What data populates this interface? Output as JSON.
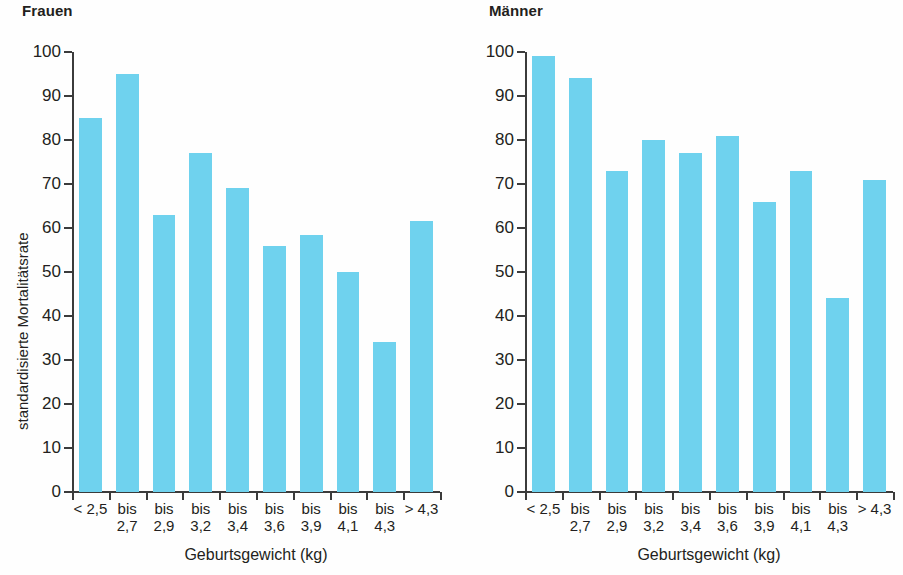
{
  "figure": {
    "bar_color": "#6fd2ee",
    "axis_color": "#3b3b3b",
    "text_color": "#231f20"
  },
  "axis": {
    "y_title": "standardisierte Mortalitätsrate",
    "x_title": "Geburtsgewicht (kg)",
    "y_ticks": [
      "100",
      "90",
      "80",
      "70",
      "60",
      "50",
      "40",
      "30",
      "20",
      "10",
      "0"
    ],
    "y_min": 0,
    "y_max": 100,
    "y_step": 10
  },
  "panels": [
    {
      "title": "Frauen"
    },
    {
      "title": "Männer"
    }
  ],
  "categories": [
    "< 2,5",
    "bis\n2,7",
    "bis\n2,9",
    "bis\n3,2",
    "bis\n3,4",
    "bis\n3,6",
    "bis\n3,9",
    "bis\n4,1",
    "bis\n4,3",
    "> 4,3"
  ],
  "chart_data": {
    "type": "bar",
    "xlabel": "Geburtsgewicht (kg)",
    "ylabel": "standardisierte Mortalitätsrate",
    "ylim": [
      0,
      100
    ],
    "ytick_step": 10,
    "grid": false,
    "legend": "none",
    "categories": [
      "< 2,5",
      "bis 2,7",
      "bis 2,9",
      "bis 3,2",
      "bis 3,4",
      "bis 3,6",
      "bis 3,9",
      "bis 4,1",
      "bis 4,3",
      "> 4,3"
    ],
    "series": [
      {
        "name": "Frauen",
        "values": [
          85,
          95,
          63,
          77,
          69,
          56,
          58.5,
          50,
          34,
          61.5
        ]
      },
      {
        "name": "Männer",
        "values": [
          99,
          94,
          73,
          80,
          77,
          81,
          66,
          73,
          44,
          71
        ]
      }
    ]
  }
}
